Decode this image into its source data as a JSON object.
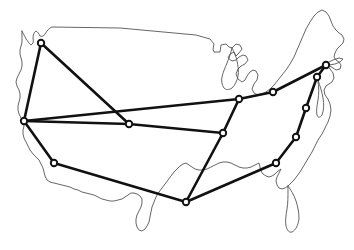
{
  "figure": {
    "kind": "node-link graph overlaid on US outline",
    "width": 354,
    "height": 250,
    "background_color": "#ffffff"
  },
  "style": {
    "outline_color": "#555555",
    "outline_width": 0.9,
    "edge_color": "#111111",
    "edge_width": 2.6,
    "node_fill": "#ffffff",
    "node_stroke": "#111111",
    "node_radius": 3.2
  },
  "chart_data": {
    "type": "scatter",
    "xlabel": "",
    "ylabel": "",
    "xlim": [
      0,
      354
    ],
    "ylim": [
      0,
      250
    ],
    "grid": false,
    "legend": "none",
    "node_count": 13,
    "edge_count": 16,
    "nodes": [
      {
        "id": "n1",
        "x": 41,
        "y": 43,
        "region": "pacific-northwest"
      },
      {
        "id": "n2",
        "x": 24,
        "y": 121,
        "region": "northern-california"
      },
      {
        "id": "n3",
        "x": 54,
        "y": 163,
        "region": "southern-california"
      },
      {
        "id": "n4",
        "x": 129,
        "y": 124,
        "region": "mountain-west"
      },
      {
        "id": "n5",
        "x": 186,
        "y": 202,
        "region": "gulf-coast-texas"
      },
      {
        "id": "n6",
        "x": 223,
        "y": 133,
        "region": "midwest-lower"
      },
      {
        "id": "n7",
        "x": 239,
        "y": 99,
        "region": "great-lakes"
      },
      {
        "id": "n8",
        "x": 273,
        "y": 92,
        "region": "ohio-valley"
      },
      {
        "id": "n9",
        "x": 326,
        "y": 65,
        "region": "new-england"
      },
      {
        "id": "n10",
        "x": 317,
        "y": 77,
        "region": "mid-atlantic-north"
      },
      {
        "id": "n11",
        "x": 306,
        "y": 108,
        "region": "mid-atlantic-south"
      },
      {
        "id": "n12",
        "x": 296,
        "y": 137,
        "region": "carolinas"
      },
      {
        "id": "n13",
        "x": 276,
        "y": 163,
        "region": "deep-south"
      }
    ],
    "edges": [
      {
        "from": "n1",
        "to": "n2"
      },
      {
        "from": "n1",
        "to": "n4"
      },
      {
        "from": "n2",
        "to": "n3"
      },
      {
        "from": "n2",
        "to": "n4"
      },
      {
        "from": "n2",
        "to": "n7"
      },
      {
        "from": "n3",
        "to": "n5"
      },
      {
        "from": "n4",
        "to": "n6"
      },
      {
        "from": "n5",
        "to": "n6"
      },
      {
        "from": "n5",
        "to": "n13"
      },
      {
        "from": "n6",
        "to": "n7"
      },
      {
        "from": "n7",
        "to": "n8"
      },
      {
        "from": "n8",
        "to": "n9"
      },
      {
        "from": "n9",
        "to": "n10"
      },
      {
        "from": "n10",
        "to": "n11"
      },
      {
        "from": "n11",
        "to": "n12"
      },
      {
        "from": "n12",
        "to": "n13"
      }
    ]
  }
}
